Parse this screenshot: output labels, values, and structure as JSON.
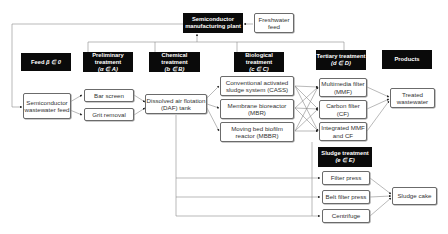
{
  "plant": {
    "label": "Semiconductor manufacturing plant"
  },
  "freshwater": {
    "label": "Freshwater feed"
  },
  "stages": {
    "feed": {
      "label": "Feed",
      "tag": "β ∈ 0"
    },
    "preliminary": {
      "label": "Preliminary treatment",
      "tag": "(α ∈ A)"
    },
    "chemical": {
      "label": "Chemical treatment",
      "tag": "(b ∈ B)"
    },
    "biological": {
      "label": "Biological treatment",
      "tag": "(c ∈ C)"
    },
    "tertiary": {
      "label": "Tertiary treatment",
      "tag": "(d ∈ D)"
    },
    "products": {
      "label": "Products"
    },
    "sludge": {
      "label": "Sludge treatment",
      "tag": "(e ∈ E)"
    }
  },
  "nodes": {
    "feed": "Semiconductor wastewater feed",
    "bar_screen": "Bar screen",
    "grit_removal": "Grit removal",
    "daf": "Dissolved air flotation (DAF) tank",
    "cass": "Conventional activated sludge system (CASS)",
    "mbr": "Membrane bioreactor (MBR)",
    "mbbr": "Moving bed biofilm reactor (MBBR)",
    "mmf": "Multimedia filter (MMF)",
    "cf": "Carbon filter (CF)",
    "integrated": "Integrated MMF and CF",
    "treated": "Treated wastewater",
    "filter_press": "Filter press",
    "belt_press": "Belt filter press",
    "centrifuge": "Centrifuge",
    "sludge_cake": "Sludge cake"
  }
}
